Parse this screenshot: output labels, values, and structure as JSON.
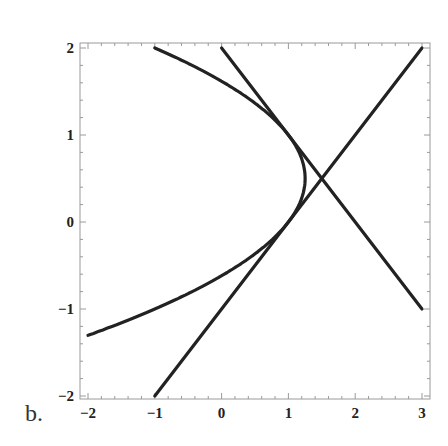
{
  "panel_label": "b.",
  "colors": {
    "curve": "#222222",
    "frame": "#9a9a9a",
    "tick_label": "#222222",
    "background": "#ffffff"
  },
  "chart_data": {
    "type": "line",
    "title": "",
    "xlabel": "",
    "ylabel": "",
    "xlim": [
      -2,
      3
    ],
    "ylim": [
      -2,
      2
    ],
    "grid": false,
    "legend": null,
    "x_ticks": [
      -2,
      -1,
      0,
      1,
      2,
      3
    ],
    "x_tick_labels": [
      "−2",
      "−1",
      "0",
      "1",
      "2",
      "3"
    ],
    "y_ticks": [
      -2,
      -1,
      0,
      1,
      2
    ],
    "y_tick_labels": [
      "−2",
      "−1",
      "0",
      "1",
      "2"
    ],
    "minor_tick_step": 0.2,
    "series": [
      {
        "name": "parabola",
        "equation": "x = 1.25 - (y - 0.5)^2",
        "description": "Sideways parabola opening left, vertex at (1.25, 0.5)",
        "points": [
          [
            -1.0,
            2.0
          ],
          [
            -0.44,
            1.75
          ],
          [
            0.0,
            1.5
          ],
          [
            0.41,
            1.25
          ],
          [
            0.75,
            1.0
          ],
          [
            1.0,
            0.75
          ],
          [
            1.19,
            0.6
          ],
          [
            1.25,
            0.5
          ],
          [
            1.19,
            0.4
          ],
          [
            1.0,
            0.0
          ],
          [
            0.71,
            -0.25
          ],
          [
            0.25,
            -0.5
          ],
          [
            -0.31,
            -0.75
          ],
          [
            -1.0,
            -1.0
          ],
          [
            -1.56,
            -1.16
          ],
          [
            -2.0,
            -1.3
          ]
        ]
      },
      {
        "name": "line-rising",
        "equation": "y = x - 1",
        "description": "Tangent to the parabola at (1, 0)",
        "points": [
          [
            -1,
            -2
          ],
          [
            3,
            2
          ]
        ]
      },
      {
        "name": "line-falling",
        "equation": "y = 2 - x",
        "description": "Tangent to the parabola at (1, 1)",
        "points": [
          [
            0,
            2
          ],
          [
            3,
            -1
          ]
        ]
      }
    ],
    "annotations": [
      {
        "label": "lines intersect",
        "x": 1.5,
        "y": 0.5
      }
    ]
  }
}
